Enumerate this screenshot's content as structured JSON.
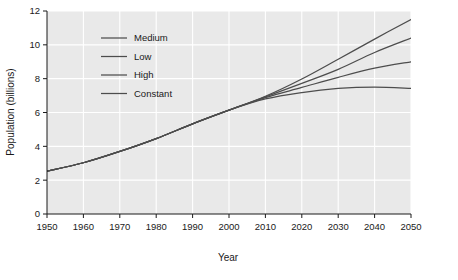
{
  "chart_data": {
    "type": "line",
    "title": "",
    "xlabel": "Year",
    "ylabel": "Population (billions)",
    "xlim": [
      1950,
      2050
    ],
    "ylim": [
      0,
      12
    ],
    "xticks": [
      1950,
      1960,
      1970,
      1980,
      1990,
      2000,
      2010,
      2020,
      2030,
      2040,
      2050
    ],
    "yticks": [
      0,
      2,
      4,
      6,
      8,
      10,
      12
    ],
    "xtick_labels": [
      "1950",
      "1960",
      "1970",
      "1980",
      "1990",
      "2000",
      "2010",
      "2020",
      "2030",
      "2040",
      "2050"
    ],
    "ytick_labels": [
      "0",
      "2",
      "4",
      "6",
      "8",
      "10",
      "12"
    ],
    "grid": true,
    "grid_color": "#ffffff",
    "plot_bgcolor": "#e9e9e9",
    "legend_position": "upper-left-inside",
    "x": [
      1950,
      1960,
      1970,
      1980,
      1990,
      2000,
      2010,
      2020,
      2030,
      2040,
      2050
    ],
    "series": [
      {
        "name": "High",
        "color": "#4d4d4d",
        "values": [
          2.53,
          3.03,
          3.7,
          4.46,
          5.33,
          6.14,
          6.96,
          7.98,
          9.15,
          10.34,
          11.5
        ]
      },
      {
        "name": "Medium",
        "color": "#4d4d4d",
        "values": [
          2.53,
          3.03,
          3.7,
          4.46,
          5.33,
          6.14,
          6.92,
          7.72,
          8.55,
          9.55,
          10.4
        ]
      },
      {
        "name": "Low",
        "color": "#4d4d4d",
        "values": [
          2.53,
          3.03,
          3.7,
          4.46,
          5.33,
          6.14,
          6.88,
          7.48,
          8.08,
          8.62,
          9.0
        ]
      },
      {
        "name": "Constant",
        "color": "#4d4d4d",
        "values": [
          2.53,
          3.03,
          3.7,
          4.46,
          5.33,
          6.14,
          6.8,
          7.18,
          7.42,
          7.5,
          7.42
        ]
      }
    ],
    "legend_entries": [
      {
        "label": "Medium",
        "color": "#4d4d4d"
      },
      {
        "label": "Low",
        "color": "#4d4d4d"
      },
      {
        "label": "High",
        "color": "#4d4d4d"
      },
      {
        "label": "Constant",
        "color": "#4d4d4d"
      }
    ]
  }
}
